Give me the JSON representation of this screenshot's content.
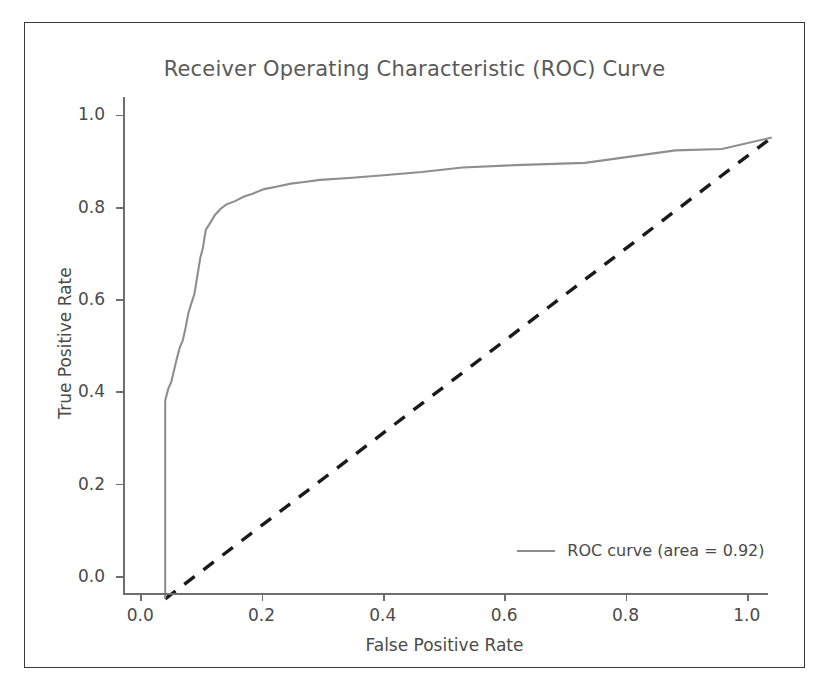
{
  "figure": {
    "title": "Receiver Operating Characteristic (ROC) Curve",
    "xlabel": "False Positive Rate",
    "ylabel": "True Positive Rate",
    "legend_label": "ROC curve (area = 0.92)",
    "curve_color": "#8e8e8e",
    "diagonal_color": "#1a1a1a",
    "axis_color": "#6e6e6e",
    "text_color": "#4a4a4a",
    "title_color": "#5a5a5a",
    "frame_color": "#3a3a3a",
    "background": "#ffffff"
  },
  "chart_data": {
    "type": "line",
    "title": "Receiver Operating Characteristic (ROC) Curve",
    "xlabel": "False Positive Rate",
    "ylabel": "True Positive Rate",
    "xlim": [
      -0.03,
      1.03
    ],
    "ylim": [
      -0.035,
      1.04
    ],
    "xticks": [
      "0.0",
      "0.2",
      "0.4",
      "0.6",
      "0.8",
      "1.0"
    ],
    "yticks": [
      "0.0",
      "0.2",
      "0.4",
      "0.6",
      "0.8",
      "1.0"
    ],
    "xtick_values": [
      0.0,
      0.2,
      0.4,
      0.6,
      0.8,
      1.0
    ],
    "ytick_values": [
      0.0,
      0.2,
      0.4,
      0.6,
      0.8,
      1.0
    ],
    "grid": false,
    "legend_position": "lower right",
    "auc": 0.92,
    "drawstyle": "steps-post",
    "series": [
      {
        "name": "ROC curve (area = 0.92)",
        "style": "solid",
        "color": "#8e8e8e",
        "x": [
          0.0,
          0.0,
          0.0,
          0.005,
          0.005,
          0.01,
          0.01,
          0.014,
          0.014,
          0.019,
          0.019,
          0.024,
          0.024,
          0.029,
          0.029,
          0.034,
          0.034,
          0.038,
          0.038,
          0.043,
          0.043,
          0.048,
          0.048,
          0.053,
          0.053,
          0.058,
          0.058,
          0.062,
          0.062,
          0.067,
          0.067,
          0.072,
          0.072,
          0.082,
          0.082,
          0.091,
          0.091,
          0.101,
          0.101,
          0.115,
          0.115,
          0.13,
          0.13,
          0.144,
          0.144,
          0.163,
          0.163,
          0.183,
          0.183,
          0.207,
          0.207,
          0.226,
          0.226,
          0.255,
          0.255,
          0.303,
          0.303,
          0.36,
          0.36,
          0.423,
          0.423,
          0.49,
          0.49,
          0.577,
          0.577,
          0.692,
          0.692,
          0.841,
          0.841,
          0.918,
          0.918,
          1.0
        ],
        "y": [
          0.0,
          0.43,
          0.43,
          0.455,
          0.455,
          0.47,
          0.47,
          0.492,
          0.492,
          0.52,
          0.52,
          0.545,
          0.545,
          0.56,
          0.56,
          0.59,
          0.59,
          0.618,
          0.618,
          0.64,
          0.64,
          0.66,
          0.66,
          0.7,
          0.7,
          0.74,
          0.74,
          0.76,
          0.76,
          0.8,
          0.8,
          0.81,
          0.81,
          0.832,
          0.832,
          0.845,
          0.845,
          0.855,
          0.855,
          0.862,
          0.862,
          0.872,
          0.872,
          0.878,
          0.878,
          0.888,
          0.888,
          0.893,
          0.893,
          0.9,
          0.9,
          0.903,
          0.903,
          0.908,
          0.908,
          0.912,
          0.912,
          0.918,
          0.918,
          0.925,
          0.925,
          0.935,
          0.935,
          0.94,
          0.94,
          0.945,
          0.945,
          0.972,
          0.972,
          0.975,
          0.975,
          1.0
        ]
      },
      {
        "name": "chance",
        "style": "dashed",
        "color": "#1a1a1a",
        "x": [
          0.0,
          1.0
        ],
        "y": [
          0.0,
          1.0
        ]
      }
    ]
  }
}
